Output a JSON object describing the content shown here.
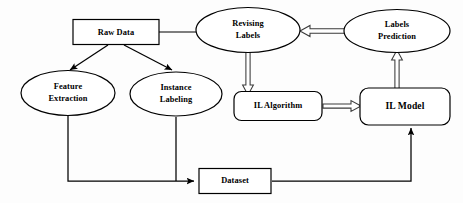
{
  "diagram": {
    "background_color": "#fdfdfd",
    "stroke_color": "#000000",
    "nodes": [
      {
        "id": "raw_data",
        "label": "Raw Data",
        "shape": "rectangle",
        "x": 116,
        "y": 32,
        "w": 86,
        "h": 25
      },
      {
        "id": "revising_labels",
        "label_line1": "Revising",
        "label_line2": "Labels",
        "shape": "ellipse",
        "x": 248,
        "y": 30,
        "w": 104,
        "h": 45
      },
      {
        "id": "labels_prediction",
        "label_line1": "Labels",
        "label_line2": "Prediction",
        "shape": "ellipse",
        "x": 397,
        "y": 31,
        "w": 106,
        "h": 43
      },
      {
        "id": "feature_extraction",
        "label_line1": "Feature",
        "label_line2": "Extraction",
        "shape": "ellipse",
        "x": 68,
        "y": 93,
        "w": 94,
        "h": 45
      },
      {
        "id": "instance_labeling",
        "label_line1": "Instance",
        "label_line2": "Labeling",
        "shape": "ellipse",
        "x": 176,
        "y": 94,
        "w": 92,
        "h": 44
      },
      {
        "id": "il_algorithm",
        "label": "IL Algorithm",
        "shape": "rounded-rectangle",
        "x": 278,
        "y": 106,
        "w": 88,
        "h": 29
      },
      {
        "id": "il_model",
        "label": "IL Model",
        "shape": "rounded-rectangle",
        "x": 405,
        "y": 106,
        "w": 90,
        "h": 37
      },
      {
        "id": "dataset",
        "label": "Dataset",
        "shape": "rectangle",
        "x": 235,
        "y": 181,
        "w": 72,
        "h": 25
      }
    ],
    "edges": [
      {
        "id": "raw-to-revising",
        "from": "raw_data",
        "to": "revising_labels",
        "style": "plain-line",
        "arrow": "none"
      },
      {
        "id": "raw-to-feature",
        "from": "raw_data",
        "to": "feature_extraction",
        "style": "solid-line",
        "arrow": "solid"
      },
      {
        "id": "raw-to-instance",
        "from": "raw_data",
        "to": "instance_labeling",
        "style": "solid-line",
        "arrow": "solid"
      },
      {
        "id": "prediction-to-revising",
        "from": "labels_prediction",
        "to": "revising_labels",
        "style": "hollow-arrow",
        "arrow": "hollow",
        "direction": "left"
      },
      {
        "id": "revising-to-il-algorithm",
        "from": "revising_labels",
        "to": "il_algorithm",
        "style": "hollow-arrow",
        "arrow": "hollow",
        "direction": "down"
      },
      {
        "id": "il-model-to-prediction",
        "from": "il_model",
        "to": "labels_prediction",
        "style": "hollow-arrow",
        "arrow": "hollow",
        "direction": "up"
      },
      {
        "id": "il-algorithm-to-il-model",
        "from": "il_algorithm",
        "to": "il_model",
        "style": "hollow-arrow",
        "arrow": "hollow",
        "direction": "right"
      },
      {
        "id": "feature-to-dataset",
        "from": "feature_extraction",
        "to": "dataset",
        "style": "solid-line",
        "arrow": "solid"
      },
      {
        "id": "instance-to-dataset",
        "from": "instance_labeling",
        "to": "dataset",
        "style": "solid-line",
        "arrow": "solid"
      },
      {
        "id": "dataset-to-il-model",
        "from": "dataset",
        "to": "il_model",
        "style": "solid-line",
        "arrow": "solid"
      }
    ]
  }
}
